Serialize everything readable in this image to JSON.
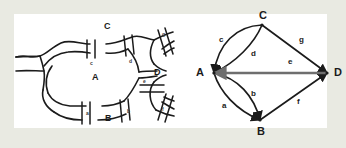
{
  "figure": {
    "frame_color": "#e9eae2",
    "panel_color": "#ffffff",
    "ink_color": "#1b1b1b",
    "accent_edge_color": "#6e6e6e"
  },
  "map": {
    "caption": "river map with seven bridges",
    "regions": [
      {
        "id": "A",
        "label": "A",
        "x": 92,
        "y": 72
      },
      {
        "id": "B",
        "label": "B",
        "x": 95,
        "y": 120
      },
      {
        "id": "C",
        "label": "C",
        "x": 90,
        "y": 20
      },
      {
        "id": "D",
        "label": "D",
        "x": 152,
        "y": 68
      }
    ],
    "bridges": [
      {
        "id": "a",
        "label": "a",
        "x": 73,
        "y": 113
      },
      {
        "id": "b",
        "label": "b",
        "x": 115,
        "y": 113
      },
      {
        "id": "c",
        "label": "c",
        "x": 77,
        "y": 57
      },
      {
        "id": "d",
        "label": "d",
        "x": 114,
        "y": 57
      },
      {
        "id": "e",
        "label": "e",
        "x": 131,
        "y": 75
      },
      {
        "id": "f",
        "label": "f",
        "x": 160,
        "y": 104
      },
      {
        "id": "g",
        "label": "g",
        "x": 158,
        "y": 29
      }
    ]
  },
  "graph": {
    "caption": "multigraph of the bridges",
    "vertices": [
      {
        "id": "A",
        "label": "A",
        "x": 40,
        "y": 59,
        "label_x": 27,
        "label_y": 59
      },
      {
        "id": "B",
        "label": "B",
        "x": 86,
        "y": 106,
        "label_x": 86,
        "label_y": 119
      },
      {
        "id": "C",
        "label": "C",
        "x": 88,
        "y": 11,
        "label_x": 88,
        "label_y": 1
      },
      {
        "id": "D",
        "label": "D",
        "x": 153,
        "y": 59,
        "label_x": 166,
        "label_y": 59
      }
    ],
    "edges": [
      {
        "id": "a",
        "label": "a",
        "from": "A",
        "to": "B",
        "shape": "curve-outer",
        "label_x": 50,
        "label_y": 93
      },
      {
        "id": "b",
        "label": "b",
        "from": "A",
        "to": "B",
        "shape": "curve-inner",
        "label_x": 79,
        "label_y": 81
      },
      {
        "id": "c",
        "label": "c",
        "from": "A",
        "to": "C",
        "shape": "curve-outer",
        "label_x": 47,
        "label_y": 27
      },
      {
        "id": "d",
        "label": "d",
        "from": "A",
        "to": "C",
        "shape": "curve-inner",
        "label_x": 79,
        "label_y": 41
      },
      {
        "id": "e",
        "label": "e",
        "from": "A",
        "to": "D",
        "shape": "straight",
        "label_x": 117,
        "label_y": 49
      },
      {
        "id": "f",
        "label": "f",
        "from": "B",
        "to": "D",
        "shape": "straight",
        "label_x": 126,
        "label_y": 89
      },
      {
        "id": "g",
        "label": "g",
        "from": "C",
        "to": "D",
        "shape": "straight",
        "label_x": 128,
        "label_y": 27
      }
    ]
  }
}
